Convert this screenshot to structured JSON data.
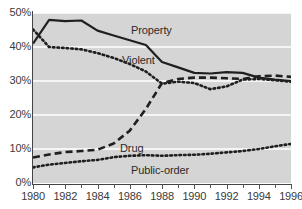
{
  "chart_data": {
    "type": "line",
    "title": "",
    "xlabel": "",
    "ylabel": "",
    "xlim": [
      1980,
      1996
    ],
    "ylim": [
      0,
      50
    ],
    "grid": true,
    "legend_position": "inline-annotations",
    "x": [
      1980,
      1981,
      1982,
      1983,
      1984,
      1985,
      1986,
      1987,
      1988,
      1989,
      1990,
      1991,
      1992,
      1993,
      1994,
      1995,
      1996
    ],
    "y_ticks": [
      0,
      10,
      20,
      30,
      40,
      50
    ],
    "y_tick_labels": [
      "0%",
      "10%",
      "20%",
      "30%",
      "40%",
      "50%"
    ],
    "x_ticks": [
      1980,
      1982,
      1984,
      1986,
      1988,
      1990,
      1992,
      1994,
      1996
    ],
    "x_tick_labels": [
      "1980",
      "1982",
      "1984",
      "1986",
      "1988",
      "1990",
      "1992",
      "1994",
      "1996"
    ],
    "x_minor_ticks": [
      1981,
      1983,
      1985,
      1987,
      1989,
      1991,
      1993,
      1995
    ],
    "series": [
      {
        "name": "Property",
        "style": "solid",
        "color": "#1f1f1f",
        "values": [
          41.0,
          48.0,
          47.6,
          47.8,
          44.8,
          43.4,
          42.0,
          40.6,
          35.6,
          34.0,
          32.4,
          32.2,
          32.6,
          32.4,
          31.0,
          30.4,
          30.0
        ]
      },
      {
        "name": "Violent",
        "style": "dotted",
        "color": "#1f1f1f",
        "values": [
          45.2,
          40.0,
          39.7,
          39.3,
          38.2,
          36.8,
          35.0,
          32.8,
          29.2,
          29.8,
          29.4,
          27.6,
          28.4,
          30.4,
          30.6,
          30.2,
          29.8
        ]
      },
      {
        "name": "Drug",
        "style": "dashed",
        "color": "#1f1f1f",
        "values": [
          7.5,
          8.4,
          9.1,
          9.4,
          9.8,
          11.6,
          15.4,
          21.8,
          29.4,
          30.6,
          31.0,
          31.0,
          30.8,
          30.6,
          31.4,
          31.6,
          31.2
        ]
      },
      {
        "name": "Public-order",
        "style": "dotted",
        "color": "#1f1f1f",
        "values": [
          4.6,
          5.4,
          5.9,
          6.4,
          6.8,
          7.6,
          8.0,
          8.2,
          8.0,
          8.2,
          8.3,
          8.6,
          9.0,
          9.4,
          10.0,
          10.8,
          11.5
        ]
      }
    ],
    "annotations": [
      {
        "text": "Property",
        "series": "Property"
      },
      {
        "text": "Violent",
        "series": "Violent"
      },
      {
        "text": "Drug",
        "series": "Drug"
      },
      {
        "text": "Public-order",
        "series": "Public-order"
      }
    ],
    "colors": {
      "plot_background": "#d5d5d5",
      "gridline": "#ffffff",
      "axis": "#444444",
      "text": "#3a3a3a",
      "line": "#1f1f1f"
    }
  }
}
